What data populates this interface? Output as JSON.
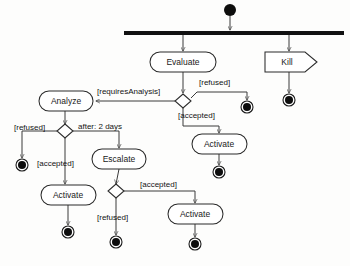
{
  "diagram": {
    "type": "activity-diagram",
    "canvas": {
      "width": 350,
      "height": 266,
      "background": "#fdfdfc"
    },
    "colors": {
      "stroke": "#2b2b2b",
      "flow": "#3a3a3a",
      "fill": "#ffffff",
      "solid": "#0d0d0d",
      "text": "#1a1a1a"
    },
    "nodes": {
      "initial": {
        "name": "initial-node",
        "cx": 230,
        "cy": 10,
        "r": 6
      },
      "fork": {
        "name": "fork-bar",
        "x": 124,
        "y": 31,
        "width": 220,
        "height": 4
      },
      "evaluate": {
        "label": "Evaluate",
        "x": 150,
        "y": 52,
        "width": 66,
        "height": 20,
        "cx": 183,
        "cy": 62
      },
      "kill": {
        "label": "Kill",
        "x": 265,
        "y": 52,
        "width": 52,
        "height": 20,
        "cx": 289,
        "cy": 62
      },
      "analyze": {
        "label": "Analyze",
        "x": 39,
        "y": 91,
        "width": 54,
        "height": 20,
        "cx": 66,
        "cy": 101
      },
      "escalate": {
        "label": "Escalate",
        "x": 92,
        "y": 149,
        "width": 54,
        "height": 20,
        "cx": 119,
        "cy": 159
      },
      "activate_left": {
        "label": "Activate",
        "x": 41,
        "y": 185,
        "width": 55,
        "height": 20,
        "cx": 68,
        "cy": 195
      },
      "activate_mid": {
        "label": "Activate",
        "x": 192,
        "y": 134,
        "width": 55,
        "height": 20,
        "cx": 219,
        "cy": 144
      },
      "activate_right": {
        "label": "Activate",
        "x": 168,
        "y": 204,
        "width": 55,
        "height": 20,
        "cx": 195,
        "cy": 214
      }
    },
    "decisions": {
      "decision_evaluate": {
        "name": "decision-after-evaluate",
        "cx": 183,
        "cy": 101,
        "rx": 8,
        "ry": 7
      },
      "decision_analyze": {
        "name": "decision-after-analyze",
        "cx": 65,
        "cy": 131,
        "rx": 8,
        "ry": 7
      },
      "decision_escalate": {
        "name": "decision-after-escalate",
        "cx": 116,
        "cy": 191,
        "rx": 8,
        "ry": 7
      }
    },
    "final_nodes": [
      {
        "name": "final-node-kill",
        "cx": 289,
        "cy": 100,
        "r": 6
      },
      {
        "name": "final-node-refused-evaluate",
        "cx": 247,
        "cy": 107,
        "r": 6
      },
      {
        "name": "final-node-refused-analyze",
        "cx": 22,
        "cy": 165,
        "r": 6
      },
      {
        "name": "final-node-activate-left",
        "cx": 68,
        "cy": 232,
        "r": 6
      },
      {
        "name": "final-node-activate-mid",
        "cx": 219,
        "cy": 172,
        "r": 6
      },
      {
        "name": "final-node-refused-escalate",
        "cx": 116,
        "cy": 242,
        "r": 6
      },
      {
        "name": "final-node-activate-right",
        "cx": 195,
        "cy": 244,
        "r": 6
      }
    ],
    "guards": {
      "refused_evaluate": {
        "text": "[refused]",
        "x": 199,
        "y": 83
      },
      "requires_analysis": {
        "text": "[requiresAnalysis]",
        "x": 97,
        "y": 92
      },
      "accepted_evaluate": {
        "text": "[accepted]",
        "x": 178,
        "y": 116
      },
      "refused_analyze": {
        "text": "[refused]",
        "x": 14,
        "y": 128
      },
      "after_two_days": {
        "text": "after: 2 days",
        "x": 78,
        "y": 127
      },
      "accepted_analyze": {
        "text": "[accepted]",
        "x": 37,
        "y": 164
      },
      "accepted_escalate": {
        "text": "[accepted]",
        "x": 140,
        "y": 185
      },
      "refused_escalate": {
        "text": "[refused]",
        "x": 97,
        "y": 218
      }
    }
  }
}
